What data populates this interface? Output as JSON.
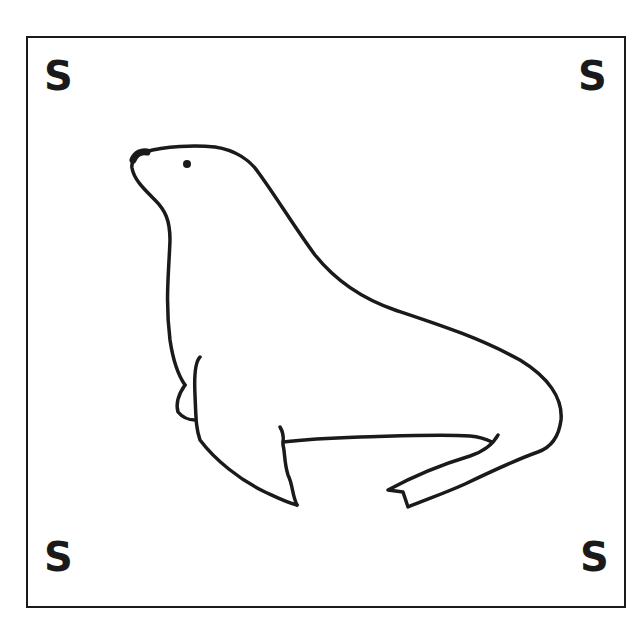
{
  "card": {
    "subject": "sea lion",
    "corner_letters": {
      "top_left": "S",
      "top_right": "S",
      "bottom_left": "S",
      "bottom_right": "S"
    }
  },
  "colors": {
    "ink": "#1a1a1a",
    "background": "#ffffff"
  }
}
